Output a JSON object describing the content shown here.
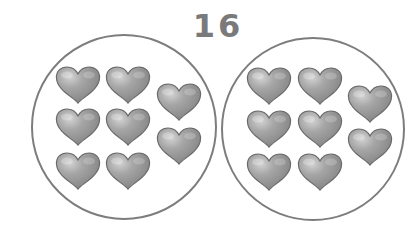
{
  "title": "16",
  "colors": {
    "circle_stroke": "#7d7d7d",
    "heart_light": "#c8c8c8",
    "heart_mid": "#9a9a9a",
    "heart_dark": "#6e6e6e",
    "heart_outline": "#6a6a6a",
    "number": "#7a7a7a"
  },
  "groups": [
    {
      "name": "left-group",
      "count": 8,
      "circle": {
        "cx": 124,
        "cy": 127,
        "r": 92
      },
      "hearts": [
        {
          "x": 55,
          "y": 66
        },
        {
          "x": 105,
          "y": 66
        },
        {
          "x": 55,
          "y": 108
        },
        {
          "x": 105,
          "y": 108
        },
        {
          "x": 55,
          "y": 152
        },
        {
          "x": 105,
          "y": 152
        },
        {
          "x": 156,
          "y": 83
        },
        {
          "x": 156,
          "y": 127
        }
      ]
    },
    {
      "name": "right-group",
      "count": 8,
      "circle": {
        "cx": 313,
        "cy": 129,
        "r": 91
      },
      "hearts": [
        {
          "x": 246,
          "y": 67
        },
        {
          "x": 297,
          "y": 67
        },
        {
          "x": 246,
          "y": 110
        },
        {
          "x": 297,
          "y": 110
        },
        {
          "x": 246,
          "y": 153
        },
        {
          "x": 297,
          "y": 153
        },
        {
          "x": 347,
          "y": 85
        },
        {
          "x": 347,
          "y": 128
        }
      ]
    }
  ],
  "heart_size": {
    "w": 46,
    "h": 38
  }
}
